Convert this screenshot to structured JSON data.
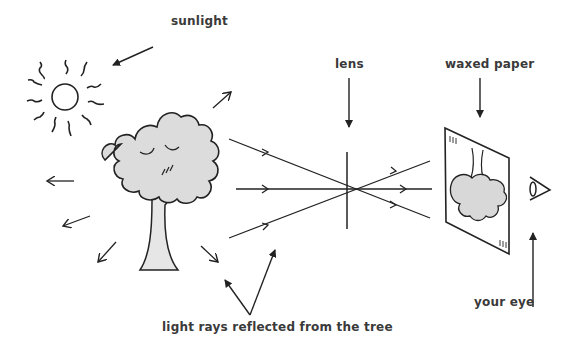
{
  "diagram": {
    "labels": {
      "sunlight": "sunlight",
      "lens": "lens",
      "waxed_paper": "waxed paper",
      "your_eye": "your eye",
      "light_rays": "light rays reflected from the tree"
    },
    "colors": {
      "ink": "#222222",
      "foliage": "#dcdcdc",
      "label": "#3a3a3a",
      "background": "#ffffff"
    },
    "elements": [
      {
        "name": "sun",
        "type": "circle-with-wavy-rays"
      },
      {
        "name": "tree",
        "type": "illustration"
      },
      {
        "name": "lens",
        "type": "cross-mark"
      },
      {
        "name": "waxed-paper",
        "type": "screen-with-inverted-tree-image"
      },
      {
        "name": "eye",
        "type": "icon"
      }
    ]
  }
}
